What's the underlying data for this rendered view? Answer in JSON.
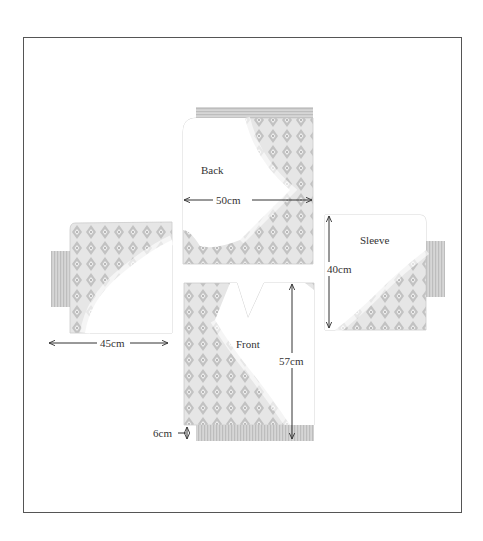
{
  "diagram": {
    "title": "",
    "pieces": {
      "back": {
        "label": "Back",
        "width_label": "50cm"
      },
      "front": {
        "label": "Front",
        "height_label": "57cm",
        "ribbing_label": "6cm"
      },
      "left_sleeve": {
        "width_label": "45cm"
      },
      "right_sleeve": {
        "label": "Sleeve",
        "height_label": "40cm"
      }
    },
    "colors": {
      "frame": "#555555",
      "pattern": "#b8b8b8",
      "ribbing": "#c4c4c4",
      "text": "#333333"
    }
  }
}
